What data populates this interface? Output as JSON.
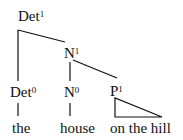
{
  "tree": {
    "nodes": {
      "root": {
        "cat": "Det",
        "bar": "1"
      },
      "n_bar": {
        "cat": "N",
        "bar": "1"
      },
      "det_head": {
        "cat": "Det",
        "bar": "0"
      },
      "n_head": {
        "cat": "N",
        "bar": "0"
      },
      "p_bar": {
        "cat": "P",
        "bar": "1"
      }
    },
    "words": {
      "det": "the",
      "noun": "house",
      "pp": "on the hill"
    }
  },
  "colors": {
    "line": "#111111",
    "background": "#ffffff"
  }
}
